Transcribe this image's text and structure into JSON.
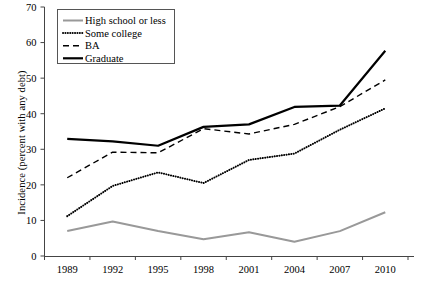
{
  "chart_data": {
    "type": "line",
    "title": "",
    "xlabel": "",
    "ylabel": "Incidence (percent with any debt)",
    "categories": [
      "1989",
      "1992",
      "1995",
      "1998",
      "2001",
      "2004",
      "2007",
      "2010"
    ],
    "x": [
      1989,
      1992,
      1995,
      1998,
      2001,
      2004,
      2007,
      2010
    ],
    "ylim": [
      0,
      70
    ],
    "yticks": [
      0,
      10,
      20,
      30,
      40,
      50,
      60,
      70
    ],
    "ytick_labels": [
      "0",
      "10",
      "20",
      "30",
      "40",
      "50",
      "60",
      "70"
    ],
    "grid": false,
    "legend_position": "top-left",
    "series": [
      {
        "name": "High school or less",
        "style": "solid",
        "color": "#999999",
        "width": 2.0,
        "values": [
          7.0,
          9.7,
          7.0,
          4.7,
          6.7,
          4.0,
          7.0,
          12.3
        ]
      },
      {
        "name": "Some college",
        "style": "dotted",
        "color": "#000000",
        "width": 2.0,
        "values": [
          11.2,
          19.7,
          23.5,
          20.5,
          27.0,
          28.8,
          35.5,
          41.5
        ]
      },
      {
        "name": "BA",
        "style": "dashed",
        "color": "#000000",
        "width": 1.4,
        "values": [
          22.0,
          29.2,
          29.0,
          35.8,
          34.3,
          37.0,
          42.0,
          49.5
        ]
      },
      {
        "name": "Graduate",
        "style": "solid",
        "color": "#000000",
        "width": 2.2,
        "values": [
          32.9,
          32.2,
          31.0,
          36.3,
          37.0,
          41.9,
          42.3,
          57.7
        ]
      }
    ]
  },
  "legend": {
    "items": [
      {
        "label": "High school or less"
      },
      {
        "label": "Some college"
      },
      {
        "label": "BA"
      },
      {
        "label": "Graduate"
      }
    ]
  }
}
